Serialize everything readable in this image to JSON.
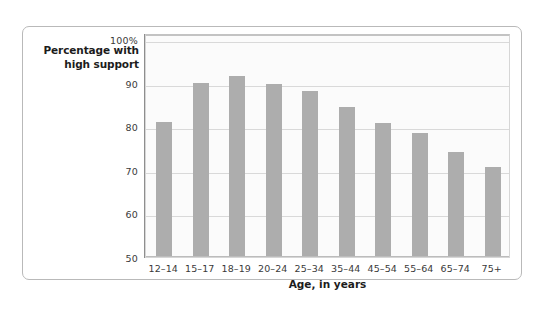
{
  "chart_data": {
    "type": "bar",
    "title": "",
    "ylabel": "Percentage with high support",
    "ylabel_line1": "Percentage with",
    "ylabel_line2": "high support",
    "xlabel": "Age, in years",
    "categories": [
      "12–14",
      "15–17",
      "18–19",
      "20–24",
      "25–34",
      "35–44",
      "45–54",
      "55–64",
      "65–74",
      "75+"
    ],
    "values": [
      81.0,
      89.8,
      91.5,
      89.7,
      88.0,
      84.5,
      80.7,
      78.5,
      74.0,
      70.7
    ],
    "ylim": [
      50,
      100
    ],
    "ytick_labels": [
      "100%",
      "90",
      "80",
      "70",
      "60",
      "50"
    ],
    "ytick_values": [
      100,
      90,
      80,
      70,
      60,
      50
    ],
    "grid": true,
    "legend": null,
    "bar_color": "#adadad",
    "plot_background": "#fbfbfb",
    "gridline_color": "#d9d9d9",
    "border_color": "#b9b9b9"
  }
}
